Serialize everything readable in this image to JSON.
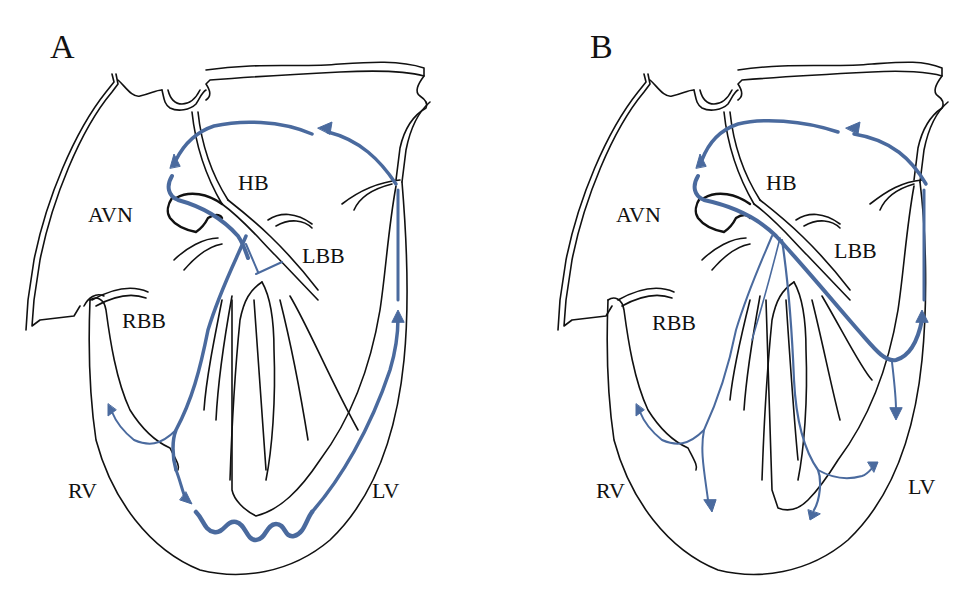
{
  "figure": {
    "colors": {
      "conduction_path": "#4a6a9e",
      "outline": "#111111",
      "background": "#ffffff"
    },
    "panels": [
      {
        "id": "A",
        "letter": "A",
        "labels": {
          "hb": "HB",
          "avn": "AVN",
          "lbb": "LBB",
          "rbb": "RBB",
          "rv": "RV",
          "lv": "LV"
        }
      },
      {
        "id": "B",
        "letter": "B",
        "labels": {
          "hb": "HB",
          "avn": "AVN",
          "lbb": "LBB",
          "rbb": "RBB",
          "rv": "RV",
          "lv": "LV"
        }
      }
    ]
  }
}
